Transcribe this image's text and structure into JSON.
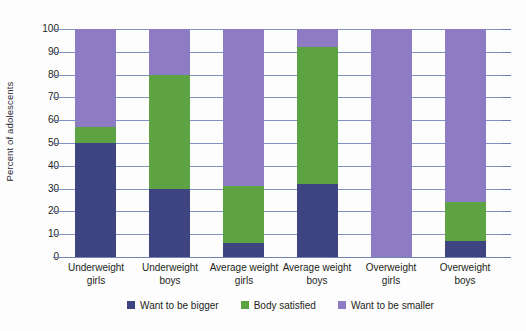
{
  "chart_data": {
    "type": "bar",
    "subtype": "stacked-bar-100",
    "title": "",
    "xlabel": "",
    "ylabel": "Percent of adolescents",
    "ylim": [
      0,
      100
    ],
    "yticks": [
      0,
      10,
      20,
      30,
      40,
      50,
      60,
      70,
      80,
      90,
      100
    ],
    "ytick_labels": [
      "0",
      "10",
      "20",
      "30",
      "40",
      "50",
      "60",
      "70",
      "80",
      "90",
      "100"
    ],
    "grid": true,
    "legend_position": "bottom-center",
    "categories": [
      "Underweight girls",
      "Underweight boys",
      "Average weight girls",
      "Average weight boys",
      "Overweight girls",
      "Overweight boys"
    ],
    "category_lines": [
      [
        "Underweight",
        "girls"
      ],
      [
        "Underweight",
        "boys"
      ],
      [
        "Average weight",
        "girls"
      ],
      [
        "Average weight",
        "boys"
      ],
      [
        "Overweight",
        "girls"
      ],
      [
        "Overweight",
        "boys"
      ]
    ],
    "series": [
      {
        "name": "Want to be bigger",
        "color": "#3e4480",
        "values": [
          50,
          30,
          6,
          32,
          0,
          7
        ]
      },
      {
        "name": "Body satisfied",
        "color": "#5da343",
        "values": [
          7,
          50,
          25,
          60,
          0,
          17
        ]
      },
      {
        "name": "Want to be smaller",
        "color": "#8d7cc4",
        "values": [
          43,
          20,
          69,
          8,
          100,
          76
        ]
      }
    ],
    "cumulative_tops": [
      [
        50,
        57,
        100
      ],
      [
        30,
        80,
        100
      ],
      [
        6,
        31,
        100
      ],
      [
        32,
        92,
        100
      ],
      [
        0,
        0,
        100
      ],
      [
        7,
        24,
        100
      ]
    ]
  },
  "legend": {
    "items": [
      {
        "label": "Want to be bigger",
        "color": "#3e4480"
      },
      {
        "label": "Body satisfied",
        "color": "#5da343"
      },
      {
        "label": "Want to be smaller",
        "color": "#8d7cc4"
      }
    ]
  }
}
